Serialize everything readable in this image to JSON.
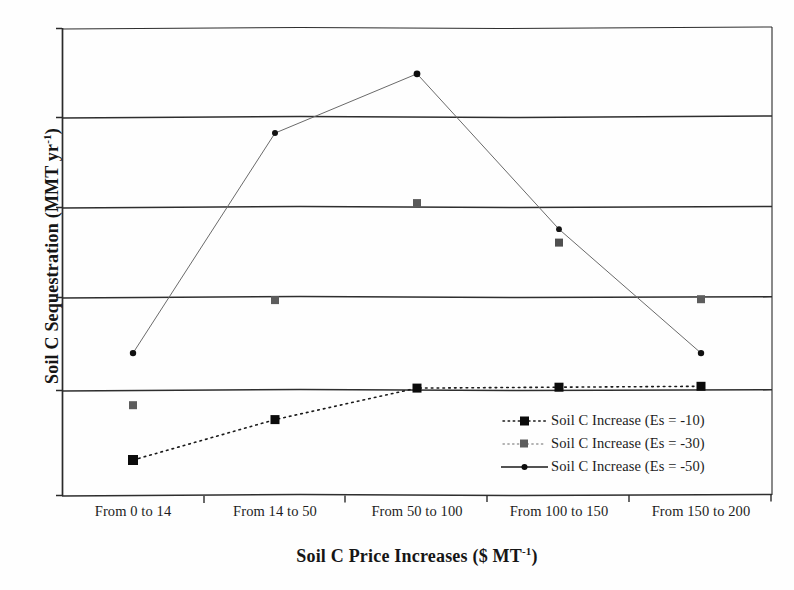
{
  "chart_data": {
    "type": "line",
    "title": "",
    "xlabel": "Soil C Price Increases ($ MT-1)",
    "xlabel_base": "Soil C Price Increases ($ MT",
    "xlabel_sup": "-1",
    "xlabel_tail": ")",
    "ylabel": "Soil C Sequestration (MMT yr-1)",
    "ylabel_base": "Soil C Sequestration (MMT yr",
    "ylabel_sup": "-1",
    "ylabel_tail": ")",
    "categories": [
      "From 0 to 14",
      "From 14 to 50",
      "From 50 to 100",
      "From 100 to 150",
      "From 150 to 200"
    ],
    "ylim": [
      -1.2,
      4.0
    ],
    "ytick_values": [
      -1.2,
      -0.2,
      0.8,
      1.8,
      2.8,
      3.8
    ],
    "ytick_labels": [
      "",
      "",
      "",
      "",
      "",
      ""
    ],
    "grid": true,
    "grid_axis": "y",
    "legend_position": "inside-lower-right",
    "series": [
      {
        "name": "Soil C Increase (Es = -10)",
        "values": [
          -0.81,
          -0.36,
          -0.01,
          0.0,
          0.01
        ],
        "marker": "square",
        "marker_size": 7,
        "color": "#101010",
        "line_style": "dotted"
      },
      {
        "name": "Soil C Increase (Es = -30)",
        "values": [
          -0.2,
          0.97,
          2.05,
          1.61,
          0.98
        ],
        "marker": "square",
        "marker_size": 7,
        "color": "#5a5a5a",
        "line_style": "none"
      },
      {
        "name": "Soil C Increase (Es = -50)",
        "values": [
          0.38,
          2.83,
          3.49,
          1.76,
          0.38
        ],
        "marker": "dot",
        "marker_size": 5,
        "color": "#1a1a1a",
        "line_style": "solid"
      }
    ]
  },
  "axes": {
    "axis_color": "#2a2a2a",
    "grid_color": "#2e2e2e",
    "frame_color": "#3a3a3a"
  },
  "legend": {
    "entries": [
      {
        "label": "Soil C Increase (Es = -10)",
        "key": "dotted-dark-square-key"
      },
      {
        "label": "Soil C Increase (Es = -30)",
        "key": "dotted-gray-square-key"
      },
      {
        "label": "Soil C Increase (Es = -50)",
        "key": "solid-dot-key"
      }
    ]
  }
}
